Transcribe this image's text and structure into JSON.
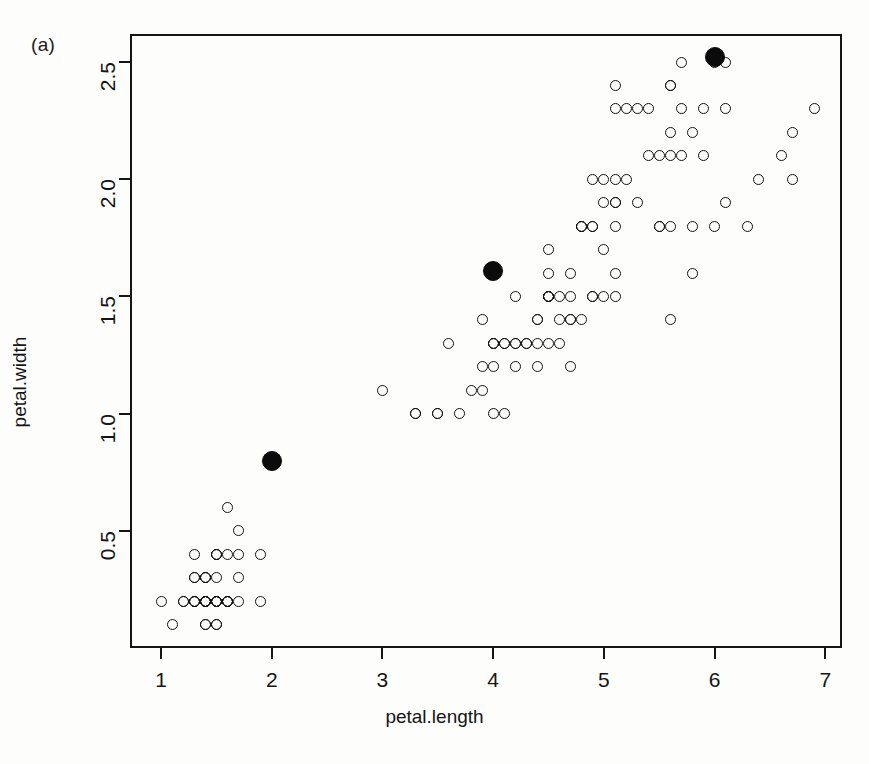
{
  "figure": {
    "panel_label": "(a)",
    "xlabel": "petal.length",
    "ylabel": "petal.width"
  },
  "chart_data": {
    "type": "scatter",
    "title": "",
    "xlabel": "petal.length",
    "ylabel": "petal.width",
    "xlim": [
      0.72,
      7.15
    ],
    "ylim": [
      0.0,
      2.62
    ],
    "xticks": [
      1,
      2,
      3,
      4,
      5,
      6,
      7
    ],
    "xticklabels": [
      "1",
      "2",
      "3",
      "4",
      "5",
      "6",
      "7"
    ],
    "yticks": [
      0.5,
      1.0,
      1.5,
      2.0,
      2.5
    ],
    "yticklabels": [
      "0.5",
      "1.0",
      "1.5",
      "2.0",
      "2.5"
    ],
    "grid": false,
    "legend": null,
    "annotations": [
      "(a)"
    ],
    "series": [
      {
        "name": "observations",
        "marker": "open-circle",
        "color": "#121212",
        "points": [
          [
            1.4,
            0.2
          ],
          [
            1.4,
            0.2
          ],
          [
            1.3,
            0.2
          ],
          [
            1.5,
            0.2
          ],
          [
            1.4,
            0.2
          ],
          [
            1.7,
            0.4
          ],
          [
            1.4,
            0.3
          ],
          [
            1.5,
            0.2
          ],
          [
            1.4,
            0.2
          ],
          [
            1.5,
            0.1
          ],
          [
            1.5,
            0.2
          ],
          [
            1.6,
            0.2
          ],
          [
            1.4,
            0.1
          ],
          [
            1.1,
            0.1
          ],
          [
            1.2,
            0.2
          ],
          [
            1.5,
            0.4
          ],
          [
            1.3,
            0.4
          ],
          [
            1.4,
            0.3
          ],
          [
            1.7,
            0.3
          ],
          [
            1.5,
            0.3
          ],
          [
            1.7,
            0.2
          ],
          [
            1.5,
            0.4
          ],
          [
            1.0,
            0.2
          ],
          [
            1.7,
            0.5
          ],
          [
            1.9,
            0.2
          ],
          [
            1.6,
            0.2
          ],
          [
            1.6,
            0.4
          ],
          [
            1.5,
            0.2
          ],
          [
            1.4,
            0.2
          ],
          [
            1.6,
            0.2
          ],
          [
            1.6,
            0.2
          ],
          [
            1.5,
            0.4
          ],
          [
            1.5,
            0.1
          ],
          [
            1.4,
            0.2
          ],
          [
            1.5,
            0.2
          ],
          [
            1.2,
            0.2
          ],
          [
            1.3,
            0.2
          ],
          [
            1.4,
            0.1
          ],
          [
            1.3,
            0.2
          ],
          [
            1.5,
            0.2
          ],
          [
            1.3,
            0.3
          ],
          [
            1.3,
            0.3
          ],
          [
            1.3,
            0.2
          ],
          [
            1.6,
            0.6
          ],
          [
            1.9,
            0.4
          ],
          [
            1.4,
            0.3
          ],
          [
            1.6,
            0.2
          ],
          [
            1.4,
            0.2
          ],
          [
            1.5,
            0.2
          ],
          [
            1.4,
            0.2
          ],
          [
            4.7,
            1.4
          ],
          [
            4.5,
            1.5
          ],
          [
            4.9,
            1.5
          ],
          [
            4.0,
            1.3
          ],
          [
            4.6,
            1.5
          ],
          [
            4.5,
            1.3
          ],
          [
            4.7,
            1.6
          ],
          [
            3.3,
            1.0
          ],
          [
            4.6,
            1.3
          ],
          [
            3.9,
            1.4
          ],
          [
            3.5,
            1.0
          ],
          [
            4.2,
            1.5
          ],
          [
            4.0,
            1.0
          ],
          [
            4.7,
            1.4
          ],
          [
            3.6,
            1.3
          ],
          [
            4.4,
            1.4
          ],
          [
            4.5,
            1.5
          ],
          [
            4.1,
            1.0
          ],
          [
            4.5,
            1.5
          ],
          [
            3.9,
            1.1
          ],
          [
            4.8,
            1.8
          ],
          [
            4.0,
            1.3
          ],
          [
            4.9,
            1.5
          ],
          [
            4.7,
            1.2
          ],
          [
            4.3,
            1.3
          ],
          [
            4.4,
            1.4
          ],
          [
            4.8,
            1.4
          ],
          [
            5.0,
            1.7
          ],
          [
            4.5,
            1.5
          ],
          [
            3.5,
            1.0
          ],
          [
            3.8,
            1.1
          ],
          [
            3.7,
            1.0
          ],
          [
            3.9,
            1.2
          ],
          [
            5.1,
            1.6
          ],
          [
            4.5,
            1.5
          ],
          [
            4.5,
            1.6
          ],
          [
            4.7,
            1.5
          ],
          [
            4.4,
            1.3
          ],
          [
            4.1,
            1.3
          ],
          [
            4.0,
            1.3
          ],
          [
            4.4,
            1.2
          ],
          [
            4.6,
            1.4
          ],
          [
            4.0,
            1.2
          ],
          [
            3.3,
            1.0
          ],
          [
            4.2,
            1.3
          ],
          [
            4.2,
            1.2
          ],
          [
            4.2,
            1.3
          ],
          [
            4.3,
            1.3
          ],
          [
            3.0,
            1.1
          ],
          [
            4.1,
            1.3
          ],
          [
            6.0,
            2.5
          ],
          [
            5.1,
            1.9
          ],
          [
            5.9,
            2.1
          ],
          [
            5.6,
            1.8
          ],
          [
            5.8,
            2.2
          ],
          [
            6.6,
            2.1
          ],
          [
            4.5,
            1.7
          ],
          [
            6.3,
            1.8
          ],
          [
            5.8,
            1.8
          ],
          [
            6.1,
            2.5
          ],
          [
            5.1,
            2.0
          ],
          [
            5.3,
            1.9
          ],
          [
            5.5,
            2.1
          ],
          [
            5.0,
            2.0
          ],
          [
            5.1,
            2.4
          ],
          [
            5.3,
            2.3
          ],
          [
            5.5,
            1.8
          ],
          [
            6.7,
            2.2
          ],
          [
            6.9,
            2.3
          ],
          [
            5.0,
            1.5
          ],
          [
            5.7,
            2.3
          ],
          [
            4.9,
            2.0
          ],
          [
            6.7,
            2.0
          ],
          [
            4.9,
            1.8
          ],
          [
            5.7,
            2.1
          ],
          [
            6.0,
            1.8
          ],
          [
            4.8,
            1.8
          ],
          [
            4.9,
            1.8
          ],
          [
            5.6,
            2.1
          ],
          [
            5.8,
            1.6
          ],
          [
            6.1,
            1.9
          ],
          [
            6.4,
            2.0
          ],
          [
            5.6,
            2.2
          ],
          [
            5.1,
            1.5
          ],
          [
            5.6,
            1.4
          ],
          [
            6.1,
            2.3
          ],
          [
            5.6,
            2.4
          ],
          [
            5.5,
            1.8
          ],
          [
            4.8,
            1.8
          ],
          [
            5.4,
            2.1
          ],
          [
            5.6,
            2.4
          ],
          [
            5.1,
            2.3
          ],
          [
            5.1,
            1.9
          ],
          [
            5.9,
            2.3
          ],
          [
            5.7,
            2.5
          ],
          [
            5.2,
            2.3
          ],
          [
            5.0,
            1.9
          ],
          [
            5.2,
            2.0
          ],
          [
            5.4,
            2.3
          ],
          [
            5.1,
            1.8
          ]
        ]
      },
      {
        "name": "cluster-centroids",
        "marker": "filled-circle",
        "color": "#0b0b0b",
        "points": [
          [
            2.0,
            0.8
          ],
          [
            4.0,
            1.61
          ],
          [
            6.0,
            2.52
          ]
        ]
      }
    ]
  }
}
